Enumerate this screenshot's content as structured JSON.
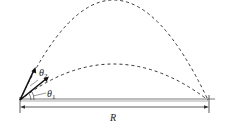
{
  "diagram": {
    "type": "projectile-range",
    "labels": {
      "theta1": "θ",
      "theta1_sub": "1",
      "theta2": "θ",
      "theta2_sub": "2",
      "range": "R"
    },
    "trajectories": [
      {
        "name": "high-angle",
        "style": "dashed",
        "launch_angle_label": "θ2"
      },
      {
        "name": "low-angle",
        "style": "dashed",
        "launch_angle_label": "θ1"
      }
    ],
    "colors": {
      "stroke": "#222222",
      "background": "#ffffff"
    }
  }
}
